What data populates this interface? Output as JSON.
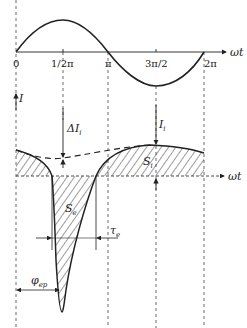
{
  "top_plot": {
    "axis_label": "ωt",
    "ticks": [
      "0",
      "1/2π",
      "π",
      "3π/2",
      "2π"
    ]
  },
  "bottom_plot": {
    "y_axis_label": "I",
    "axis_label": "ωt",
    "annotations": {
      "delta_i": "ΔI",
      "delta_i_sub": "i",
      "i_i": "I",
      "i_i_sub": "i",
      "s_i": "S",
      "s_i_sub": "i",
      "s_e": "S",
      "s_e_sub": "e",
      "tau_e": "τ",
      "tau_e_sub": "e",
      "phi_ep": "φ",
      "phi_ep_sub": "ep"
    }
  },
  "colors": {
    "line": "#222222",
    "grid": "#444444"
  }
}
